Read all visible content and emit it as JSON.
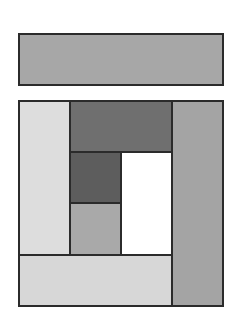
{
  "diagram": {
    "title": "",
    "border_color": "#2b2b2b",
    "background": "#ffffff",
    "shapes": [
      {
        "id": "top-bar",
        "x": 18,
        "y": 33,
        "w": 206,
        "h": 53,
        "fill": "#a7a7a7"
      },
      {
        "id": "outer-frame",
        "x": 18,
        "y": 100,
        "w": 206,
        "h": 207,
        "fill": "#ffffff"
      },
      {
        "id": "left-column",
        "x": 18,
        "y": 100,
        "w": 53,
        "h": 156,
        "fill": "#dddddd"
      },
      {
        "id": "top-center-block",
        "x": 69,
        "y": 100,
        "w": 104,
        "h": 53,
        "fill": "#6f6f6f"
      },
      {
        "id": "center-dark-square",
        "x": 69,
        "y": 151,
        "w": 53,
        "h": 53,
        "fill": "#5d5d5d"
      },
      {
        "id": "center-medium-square",
        "x": 69,
        "y": 202,
        "w": 53,
        "h": 54,
        "fill": "#a9a9a9"
      },
      {
        "id": "center-white-block",
        "x": 120,
        "y": 151,
        "w": 53,
        "h": 105,
        "fill": "#ffffff"
      },
      {
        "id": "right-column",
        "x": 171,
        "y": 100,
        "w": 53,
        "h": 207,
        "fill": "#a4a4a4"
      },
      {
        "id": "bottom-bar",
        "x": 18,
        "y": 254,
        "w": 155,
        "h": 53,
        "fill": "#d7d7d7"
      }
    ]
  }
}
